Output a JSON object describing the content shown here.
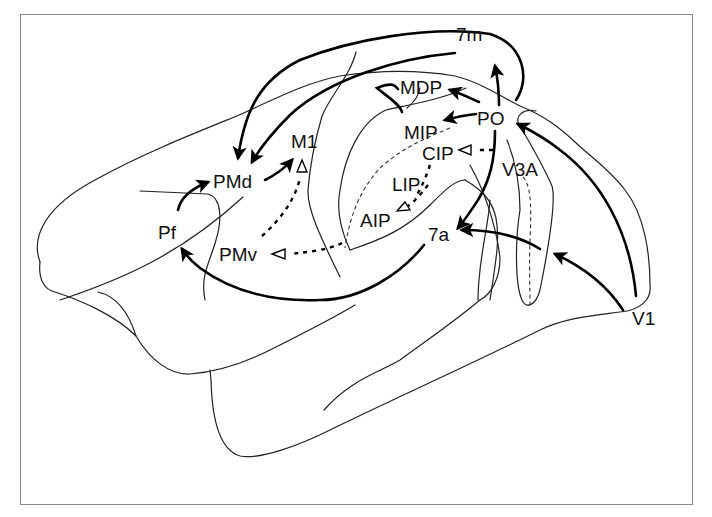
{
  "diagram": {
    "type": "brain-connectivity-schematic",
    "areas": [
      {
        "id": "7m",
        "label": "7m",
        "x": 456,
        "y": 34
      },
      {
        "id": "MDP",
        "label": "MDP",
        "x": 400,
        "y": 96
      },
      {
        "id": "PO",
        "label": "PO",
        "x": 477,
        "y": 126
      },
      {
        "id": "MIP",
        "label": "MIP",
        "x": 404,
        "y": 140
      },
      {
        "id": "CIP",
        "label": "CIP",
        "x": 422,
        "y": 160
      },
      {
        "id": "V3A",
        "label": "V3A",
        "x": 502,
        "y": 176
      },
      {
        "id": "LIP",
        "label": "LIP",
        "x": 392,
        "y": 191
      },
      {
        "id": "AIP",
        "label": "AIP",
        "x": 360,
        "y": 228
      },
      {
        "id": "7a",
        "label": "7a",
        "x": 428,
        "y": 243
      },
      {
        "id": "M1",
        "label": "M1",
        "x": 291,
        "y": 155
      },
      {
        "id": "PMd",
        "label": "PMd",
        "x": 213,
        "y": 190
      },
      {
        "id": "Pf",
        "label": "Pf",
        "x": 158,
        "y": 243
      },
      {
        "id": "PMv",
        "label": "PMv",
        "x": 219,
        "y": 262
      },
      {
        "id": "V1",
        "label": "V1",
        "x": 632,
        "y": 323
      }
    ],
    "connections": [
      {
        "from": "PO",
        "to": "7m",
        "style": "solid-arrow"
      },
      {
        "from": "PO",
        "to": "MDP",
        "style": "solid-arrow"
      },
      {
        "from": "PO",
        "to": "MIP",
        "style": "solid-arrow"
      },
      {
        "from": "PO",
        "to": "7a",
        "style": "solid-arrow"
      },
      {
        "from": "PO",
        "to": "PMd",
        "style": "solid-arrow"
      },
      {
        "from": "7m",
        "to": "PMd",
        "style": "solid-arrow"
      },
      {
        "from": "MDP",
        "to": "PMd",
        "style": "solid-arrow"
      },
      {
        "from": "PMd",
        "to": "M1",
        "style": "solid-arrow"
      },
      {
        "from": "Pf",
        "to": "PMd",
        "style": "solid-arrow"
      },
      {
        "from": "7a",
        "to": "Pf",
        "style": "solid-arrow"
      },
      {
        "from": "V1",
        "to": "PO",
        "style": "solid-arrow"
      },
      {
        "from": "V1",
        "to": "V3A",
        "style": "solid-arrow"
      },
      {
        "from": "V3A",
        "to": "7a",
        "style": "solid-arrow"
      },
      {
        "from": "PMv",
        "to": "M1",
        "style": "dashed-open-arrow"
      },
      {
        "from": "AIP",
        "to": "PMv",
        "style": "dashed-open-arrow"
      },
      {
        "from": "LIP",
        "to": "AIP",
        "style": "dashed-open-arrow"
      },
      {
        "from": "PO",
        "to": "CIP",
        "style": "dashed-open-arrow"
      }
    ]
  }
}
